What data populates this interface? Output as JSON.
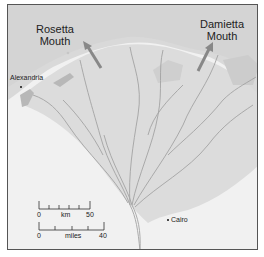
{
  "map": {
    "title": "Nile Delta",
    "colors": {
      "sea": "#d6d6d6",
      "delta_land": "#dadada",
      "desert": "#f1f1f1",
      "frame": "#555555",
      "arrow": "#8a8a8a",
      "river": "#9a9a9a",
      "lagoon": "#b8b8b8"
    },
    "labels": {
      "rosetta": {
        "line1": "Rosetta",
        "line2": "Mouth"
      },
      "damietta": {
        "line1": "Damietta",
        "line2": "Mouth"
      },
      "alexandria": "Alexandria",
      "cairo": "Cairo"
    },
    "scale_bars": [
      {
        "unit": "km",
        "start": "0",
        "end": "50"
      },
      {
        "unit": "miles",
        "start": "0",
        "end": "40"
      }
    ]
  }
}
